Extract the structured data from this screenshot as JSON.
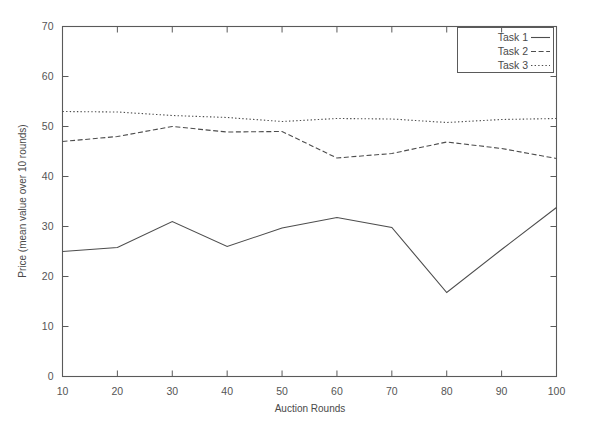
{
  "chart_data": {
    "type": "line",
    "title": "",
    "xlabel": "Auction Rounds",
    "ylabel": "Price (mean value over 10 rounds)",
    "x": [
      10,
      20,
      30,
      40,
      50,
      60,
      70,
      80,
      90,
      100
    ],
    "xlim": [
      10,
      100
    ],
    "ylim": [
      0,
      70
    ],
    "xticks": [
      "10",
      "20",
      "30",
      "40",
      "50",
      "60",
      "70",
      "80",
      "90",
      "100"
    ],
    "yticks": [
      "0",
      "10",
      "20",
      "30",
      "40",
      "50",
      "60",
      "70"
    ],
    "grid": false,
    "legend_position": "top-right",
    "series": [
      {
        "name": "Task 1",
        "style": "solid",
        "values": [
          25.0,
          25.8,
          31.0,
          26.0,
          29.7,
          31.8,
          29.8,
          16.8,
          25.4,
          33.8
        ]
      },
      {
        "name": "Task 2",
        "style": "dashed",
        "values": [
          47.0,
          48.0,
          50.0,
          48.9,
          49.0,
          43.7,
          44.6,
          46.9,
          45.6,
          43.6
        ]
      },
      {
        "name": "Task 3",
        "style": "dotted",
        "values": [
          53.0,
          52.9,
          52.2,
          51.8,
          51.0,
          51.6,
          51.5,
          50.8,
          51.4,
          51.6
        ]
      }
    ]
  },
  "legend": {
    "entries": [
      "Task 1",
      "Task 2",
      "Task 3"
    ]
  }
}
